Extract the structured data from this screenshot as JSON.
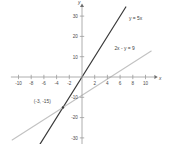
{
  "chart_data": {
    "type": "line",
    "title": "",
    "subtitle": "",
    "xlabel": "x",
    "ylabel": "y",
    "xlim": [
      -11.2,
      11.4
    ],
    "ylim": [
      -36.5,
      34.5
    ],
    "grid": false,
    "legend": "none",
    "x_ticks": [
      -10,
      -8,
      -6,
      -4,
      -2,
      2,
      4,
      6,
      8,
      10
    ],
    "x_tick_labels": [
      "-10",
      "-8",
      "-6",
      "-4",
      "-2",
      "2",
      "4",
      "6",
      "8",
      "10"
    ],
    "y_ticks": [
      -30,
      -20,
      -10,
      10,
      20,
      30
    ],
    "y_tick_labels": [
      "-30",
      "-20",
      "-10",
      "10",
      "20",
      "30"
    ],
    "series": [
      {
        "name": "y = 5x",
        "label": "y = 5x",
        "equation": "y = 5x",
        "slope": 5,
        "intercept": 0,
        "color": "#3a3a3a",
        "width": 1.2,
        "x": [
          -7.0,
          6.9
        ],
        "values": [
          -35.0,
          34.5
        ],
        "label_x": 7.4,
        "label_y": 28.0
      },
      {
        "name": "2x - y = 9",
        "label": "2x - y = 9",
        "equation": "2x - y = 9",
        "slope": 2,
        "intercept": -9,
        "color": "#c2c2c2",
        "width": 1.1,
        "x": [
          -11.0,
          10.9
        ],
        "values": [
          -31.0,
          12.8
        ],
        "label_x": 5.1,
        "label_y": 13.2
      }
    ],
    "annotations": [
      {
        "text": "(-3, -15)",
        "x": -3,
        "y": -15,
        "marker": true,
        "marker_color": "#3a3a3a",
        "label_x": -7.6,
        "label_y": -13.0
      }
    ],
    "axis_color": "#9a9a9a",
    "background": "#ffffff"
  },
  "axes": {
    "x_axis_name": "x",
    "y_axis_name": "y"
  }
}
